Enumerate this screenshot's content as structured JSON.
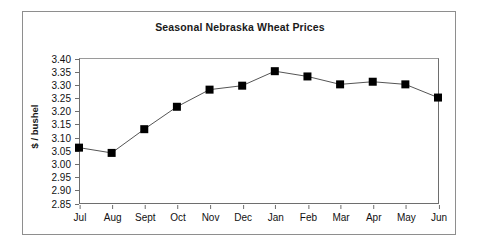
{
  "figure": {
    "background_color": "#ffffff",
    "border_color": "#8e8e8e"
  },
  "chart_data": {
    "type": "line",
    "title": "Seasonal Nebraska Wheat Prices",
    "xlabel": "",
    "ylabel": "$ / bushel",
    "categories": [
      "Jul",
      "Aug",
      "Sept",
      "Oct",
      "Nov",
      "Dec",
      "Jan",
      "Feb",
      "Mar",
      "Apr",
      "May",
      "Jun"
    ],
    "values": [
      3.06,
      3.04,
      3.13,
      3.215,
      3.28,
      3.295,
      3.35,
      3.33,
      3.3,
      3.31,
      3.3,
      3.25
    ],
    "series": [
      {
        "name": "Seasonal price index",
        "values": [
          3.06,
          3.04,
          3.13,
          3.215,
          3.28,
          3.295,
          3.35,
          3.33,
          3.3,
          3.31,
          3.3,
          3.25
        ]
      }
    ],
    "ylim": [
      2.85,
      3.4
    ],
    "ytick_step": 0.05,
    "ytick_labels": [
      "3.40",
      "3.35",
      "3.30",
      "3.25",
      "3.20",
      "3.15",
      "3.10",
      "3.05",
      "3.00",
      "2.95",
      "2.90",
      "2.85"
    ],
    "ytick_values": [
      3.4,
      3.35,
      3.3,
      3.25,
      3.2,
      3.15,
      3.1,
      3.05,
      3.0,
      2.95,
      2.9,
      2.85
    ],
    "grid": false,
    "legend": false,
    "legend_position": "none",
    "marker": "square",
    "marker_color": "#000000",
    "marker_size": 8,
    "line_color": "#555555",
    "line_width": 1
  }
}
